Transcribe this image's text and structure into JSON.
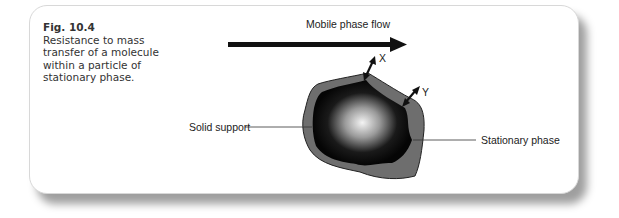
{
  "figure": {
    "number": "Fig. 10.4",
    "caption": "Resistance to mass transfer of a molecule within a particle of stationary phase."
  },
  "diagram": {
    "flow_label": "Mobile phase flow",
    "label_x": "X",
    "label_y": "Y",
    "solid_support_label": "Solid support",
    "stationary_phase_label": "Stationary phase",
    "colors": {
      "stationary_phase": "#6e6e6e",
      "solid_support_dark": "#0a0a0a",
      "solid_support_center": "#f4f4f4",
      "arrow": "#111111"
    }
  }
}
